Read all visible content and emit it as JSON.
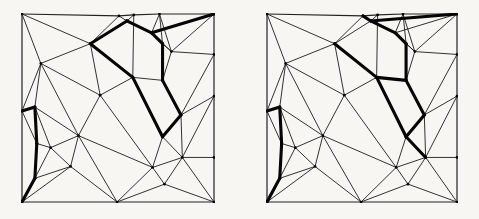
{
  "figure": {
    "background_color": "#f7f6f2",
    "thin_color": "#1c1c1c",
    "bold_color": "#050505",
    "border_color": "#222222",
    "thin_width": 0.9,
    "bold_width": 3.1,
    "border_width": 1.2,
    "vertex_dot_radius": 1.35,
    "canvas": {
      "width": 479,
      "height": 219
    },
    "panels": [
      {
        "id": "left",
        "label": "left-triangulation",
        "x": 21,
        "y": 13,
        "width": 194,
        "height": 190
      },
      {
        "id": "right",
        "label": "right-triangulation",
        "x": 266,
        "y": 13,
        "width": 192,
        "height": 190
      }
    ],
    "vertices": {
      "c0": [
        0.0,
        0.0
      ],
      "t1": [
        0.505,
        0.01
      ],
      "t2": [
        0.582,
        0.005
      ],
      "t3": [
        0.716,
        0.0
      ],
      "c1": [
        1.0,
        0.0
      ],
      "r1": [
        1.0,
        0.215
      ],
      "r2": [
        1.0,
        0.437
      ],
      "r3": [
        1.0,
        0.763
      ],
      "c2": [
        1.0,
        1.0
      ],
      "b1": [
        0.495,
        1.0
      ],
      "c3": [
        0.0,
        1.0
      ],
      "l1": [
        0.0,
        0.516
      ],
      "i1": [
        0.356,
        0.158
      ],
      "i2": [
        0.098,
        0.263
      ],
      "i3": [
        0.546,
        0.037
      ],
      "i4": [
        0.675,
        0.1
      ],
      "i5": [
        0.732,
        0.158
      ],
      "i6": [
        0.778,
        0.2
      ],
      "i7": [
        0.732,
        0.353
      ],
      "i8": [
        0.577,
        0.337
      ],
      "i9": [
        0.828,
        0.537
      ],
      "i10": [
        0.732,
        0.653
      ],
      "i11": [
        0.407,
        0.432
      ],
      "i12": [
        0.067,
        0.495
      ],
      "i13": [
        0.077,
        0.689
      ],
      "i14": [
        0.067,
        0.874
      ],
      "i15": [
        0.149,
        0.711
      ],
      "i16": [
        0.294,
        0.647
      ],
      "i17": [
        0.253,
        0.811
      ],
      "i18": [
        0.68,
        0.816
      ],
      "i19": [
        0.742,
        0.905
      ],
      "i20": [
        0.835,
        0.763
      ]
    },
    "edges": {
      "border": [
        [
          "c0",
          "t1"
        ],
        [
          "t1",
          "t2"
        ],
        [
          "t2",
          "t3"
        ],
        [
          "t3",
          "c1"
        ],
        [
          "c1",
          "r1"
        ],
        [
          "r1",
          "r2"
        ],
        [
          "r2",
          "r3"
        ],
        [
          "r3",
          "c2"
        ],
        [
          "c2",
          "b1"
        ],
        [
          "b1",
          "c3"
        ],
        [
          "c3",
          "l1"
        ],
        [
          "l1",
          "c0"
        ]
      ],
      "shared_thin": [
        [
          "c0",
          "i1"
        ],
        [
          "c0",
          "i2"
        ],
        [
          "t1",
          "i1"
        ],
        [
          "t2",
          "i3"
        ],
        [
          "t2",
          "i8"
        ],
        [
          "t3",
          "i4"
        ],
        [
          "t3",
          "i5"
        ],
        [
          "t3",
          "i6"
        ],
        [
          "c1",
          "i6"
        ],
        [
          "r1",
          "i6"
        ],
        [
          "r1",
          "i9"
        ],
        [
          "r2",
          "i9"
        ],
        [
          "r2",
          "i20"
        ],
        [
          "r3",
          "i20"
        ],
        [
          "c2",
          "i19"
        ],
        [
          "c2",
          "i20"
        ],
        [
          "b1",
          "i16"
        ],
        [
          "b1",
          "i17"
        ],
        [
          "b1",
          "i18"
        ],
        [
          "b1",
          "i19"
        ],
        [
          "c3",
          "i17"
        ],
        [
          "l1",
          "i2"
        ],
        [
          "l1",
          "i13"
        ],
        [
          "i1",
          "i2"
        ],
        [
          "i1",
          "i11"
        ],
        [
          "i2",
          "i11"
        ],
        [
          "i2",
          "i16"
        ],
        [
          "i2",
          "i12"
        ],
        [
          "i4",
          "i6"
        ],
        [
          "i5",
          "i6"
        ],
        [
          "i6",
          "i7"
        ],
        [
          "i8",
          "i11"
        ],
        [
          "i9",
          "i20"
        ],
        [
          "i10",
          "i18"
        ],
        [
          "i11",
          "i16"
        ],
        [
          "i11",
          "i18"
        ],
        [
          "i12",
          "i15"
        ],
        [
          "i12",
          "i16"
        ],
        [
          "i13",
          "i15"
        ],
        [
          "i14",
          "i15"
        ],
        [
          "i14",
          "i17"
        ],
        [
          "i15",
          "i16"
        ],
        [
          "i15",
          "i17"
        ],
        [
          "i16",
          "i17"
        ],
        [
          "i16",
          "i18"
        ],
        [
          "i18",
          "i19"
        ],
        [
          "i18",
          "i20"
        ],
        [
          "i19",
          "i20"
        ]
      ],
      "left": {
        "thin_extra": [
          [
            "t1",
            "i3"
          ],
          [
            "i7",
            "i8"
          ],
          [
            "i10",
            "i20"
          ]
        ],
        "bold": [
          [
            "i1",
            "i3"
          ],
          [
            "i3",
            "i4"
          ],
          [
            "i4",
            "i5"
          ],
          [
            "i4",
            "c1"
          ],
          [
            "i5",
            "i7"
          ],
          [
            "i1",
            "i8"
          ],
          [
            "i8",
            "i10"
          ],
          [
            "i7",
            "i9"
          ],
          [
            "i9",
            "i10"
          ],
          [
            "l1",
            "i12"
          ],
          [
            "i12",
            "i13"
          ],
          [
            "i13",
            "i14"
          ],
          [
            "i14",
            "c3"
          ]
        ]
      },
      "right": {
        "thin_extra": [
          [
            "i1",
            "i3"
          ],
          [
            "i4",
            "c1"
          ]
        ],
        "bold": [
          [
            "t1",
            "i3"
          ],
          [
            "i3",
            "i4"
          ],
          [
            "i4",
            "i5"
          ],
          [
            "i3",
            "c1"
          ],
          [
            "i5",
            "i7"
          ],
          [
            "i1",
            "i8"
          ],
          [
            "i7",
            "i8"
          ],
          [
            "i8",
            "i10"
          ],
          [
            "i7",
            "i9"
          ],
          [
            "i9",
            "i10"
          ],
          [
            "i10",
            "i20"
          ],
          [
            "l1",
            "i12"
          ],
          [
            "i12",
            "i13"
          ],
          [
            "i13",
            "i14"
          ],
          [
            "i14",
            "c3"
          ]
        ]
      }
    }
  }
}
